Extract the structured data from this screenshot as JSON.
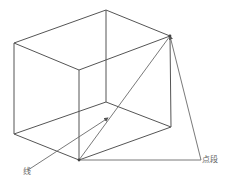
{
  "figure": {
    "type": "3d-wireframe-box",
    "labels": {
      "line": "线",
      "point_segment": "点段"
    },
    "caption": "",
    "colors": {
      "edge": "#555555",
      "diagonal": "#6a6a6a",
      "label": "#666666"
    },
    "vertices": {
      "top_left": [
        14,
        43
      ],
      "top_back": [
        106,
        10
      ],
      "top_right": [
        170,
        36
      ],
      "top_front": [
        79,
        70
      ],
      "bottom_left": [
        14,
        134
      ],
      "bottom_back": [
        106,
        102
      ],
      "bottom_right": [
        171,
        127
      ],
      "bottom_front": [
        79,
        160
      ],
      "segment_end": [
        201,
        160
      ],
      "line_start": [
        28,
        170
      ],
      "arrow_tip": [
        108,
        118
      ]
    }
  }
}
